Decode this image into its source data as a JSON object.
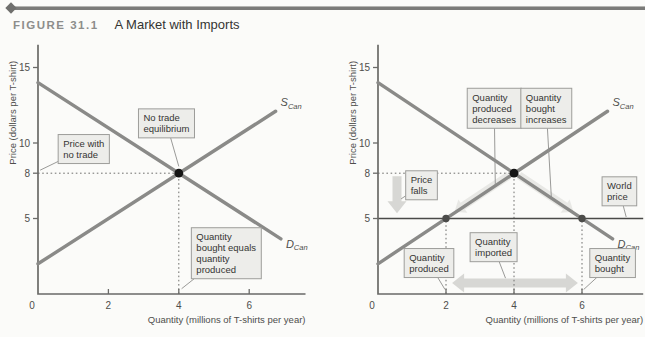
{
  "figure": {
    "label": "FIGURE 31.1",
    "title": "A Market with Imports"
  },
  "colors": {
    "curve": "#8a8a88",
    "axis": "#6a6a68",
    "tick_text": "#4e4e4c",
    "box_fill": "#ececе9",
    "box_fill2": "#ececE9",
    "box_background": "#ececeа",
    "box_face": "#ececе8",
    "boxfill": "#ececе9",
    "box": "#ececе9",
    "box_fill_hex": "#ececе9",
    "annotation_fill": "#ededea",
    "box_border": "#9d9d9a",
    "box_text": "#353533",
    "dotted": "#6f6f6d",
    "point_dark": "#141414",
    "point_mid": "#4c4c4a",
    "band": "#d9d9d5",
    "big_arrow": "#d4d4d0",
    "world_line": "#4a4a48",
    "pointer": "#8e8e8c"
  },
  "chart_data": [
    {
      "type": "line",
      "panel": "left",
      "title": "",
      "xlabel": "Quantity (millions of T-shirts per year)",
      "ylabel": "Price (dollars per T-shirt)",
      "xlim": [
        0,
        7.6
      ],
      "ylim": [
        0,
        16.5
      ],
      "x_ticks": [
        0,
        2,
        4,
        6
      ],
      "y_ticks": [
        5,
        8,
        10,
        15
      ],
      "grid": false,
      "series": [
        {
          "name": "D",
          "sub": "Can",
          "role": "demand",
          "points": [
            [
              0,
              14
            ],
            [
              6.9,
              3.65
            ]
          ]
        },
        {
          "name": "S",
          "sub": "Can",
          "role": "supply",
          "points": [
            [
              0,
              2
            ],
            [
              6.75,
              12.1
            ]
          ]
        }
      ],
      "points": [
        {
          "x": 4,
          "y": 8,
          "style": "equilibrium"
        }
      ],
      "guides": [
        {
          "from": [
            0,
            8
          ],
          "to": [
            4,
            8
          ]
        },
        {
          "from": [
            4,
            0
          ],
          "to": [
            4,
            8
          ]
        }
      ],
      "annotations": [
        {
          "text": [
            "No trade",
            "equilibrium"
          ],
          "center": [
            3.65,
            11.3
          ],
          "target": [
            4.0,
            8.45
          ]
        },
        {
          "text": [
            "Price with",
            "no trade"
          ],
          "center": [
            1.3,
            9.6
          ],
          "target": [
            0.06,
            8.2
          ]
        },
        {
          "text": [
            "Quantity",
            "bought equals",
            "quantity",
            "produced"
          ],
          "center": [
            5.35,
            2.7
          ],
          "target": [
            4.08,
            0.35
          ]
        }
      ]
    },
    {
      "type": "line",
      "panel": "right",
      "title": "",
      "xlabel": "Quantity (millions of T-shirts per year)",
      "ylabel": "Price (dollars per T-shirt)",
      "xlim": [
        0,
        7.8
      ],
      "ylim": [
        0,
        16.5
      ],
      "x_ticks": [
        0,
        2,
        4,
        6
      ],
      "y_ticks": [
        5,
        8,
        10,
        15
      ],
      "grid": false,
      "world_price": {
        "y": 5,
        "x_extent": [
          0,
          7.8
        ]
      },
      "series": [
        {
          "name": "D",
          "sub": "Can",
          "role": "demand",
          "points": [
            [
              0,
              14
            ],
            [
              6.9,
              3.65
            ]
          ]
        },
        {
          "name": "S",
          "sub": "Can",
          "role": "supply",
          "points": [
            [
              0,
              2
            ],
            [
              6.75,
              12.1
            ]
          ]
        }
      ],
      "points": [
        {
          "x": 4,
          "y": 8,
          "style": "equilibrium"
        },
        {
          "x": 2,
          "y": 5,
          "style": "dot"
        },
        {
          "x": 6,
          "y": 5,
          "style": "dot"
        }
      ],
      "guides": [
        {
          "from": [
            0,
            8
          ],
          "to": [
            4,
            8
          ]
        },
        {
          "from": [
            4,
            0
          ],
          "to": [
            4,
            8
          ]
        },
        {
          "from": [
            2,
            0
          ],
          "to": [
            2,
            5
          ]
        },
        {
          "from": [
            6,
            0
          ],
          "to": [
            6,
            5
          ]
        }
      ],
      "bands": [
        {
          "from": [
            3.85,
            7.85
          ],
          "to": [
            2.25,
            5.45
          ]
        },
        {
          "from": [
            4.15,
            7.85
          ],
          "to": [
            5.75,
            5.45
          ]
        }
      ],
      "big_arrows": [
        {
          "double": false,
          "from": [
            0.56,
            7.8
          ],
          "to": [
            0.56,
            5.35
          ]
        },
        {
          "double": true,
          "from": [
            2.18,
            0.72
          ],
          "to": [
            5.88,
            0.72
          ]
        }
      ],
      "annotations": [
        {
          "text": [
            "Quantity",
            "produced",
            "decreases"
          ],
          "center": [
            3.42,
            12.3
          ],
          "target": [
            3.45,
            7.2
          ]
        },
        {
          "text": [
            "Quantity",
            "bought",
            "increases"
          ],
          "center": [
            4.95,
            12.3
          ],
          "target": [
            5.1,
            6.35
          ]
        },
        {
          "text": [
            "Price",
            "falls"
          ],
          "center": [
            1.28,
            7.2
          ],
          "target": [
            0.68,
            6.3
          ]
        },
        {
          "text": [
            "World",
            "price"
          ],
          "center": [
            7.1,
            6.8
          ],
          "target": [
            7.3,
            5.1
          ]
        },
        {
          "text": [
            "Quantity",
            "produced"
          ],
          "center": [
            1.5,
            2.05
          ],
          "target": [
            1.97,
            0.3
          ]
        },
        {
          "text": [
            "Quantity",
            "imported"
          ],
          "center": [
            3.4,
            3.1
          ],
          "target": [
            3.75,
            1.05
          ]
        },
        {
          "text": [
            "Quantity",
            "bought"
          ],
          "center": [
            6.9,
            2.05
          ],
          "target": [
            6.05,
            0.3
          ]
        }
      ]
    }
  ]
}
